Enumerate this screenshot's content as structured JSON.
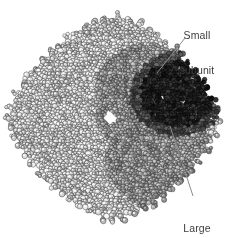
{
  "figure": {
    "kind": "space-filling-molecular-model",
    "background_color": "#ffffff",
    "width": 233,
    "height": 238
  },
  "annotations": {
    "small_subunit": {
      "line1": "Small",
      "line2": "subunit",
      "text_color": "#3d3d3d",
      "leader": {
        "x1": 185,
        "y1": 38,
        "x2": 157,
        "y2": 73,
        "color": "#8c8c8c"
      }
    },
    "large_subunit": {
      "line1": "Large",
      "line2": "subunit",
      "text_color": "#3d3d3d",
      "leader": {
        "x1": 193,
        "y1": 196,
        "x2": 170,
        "y2": 126,
        "color": "#8c8c8c"
      }
    }
  },
  "molecule": {
    "silhouette_note": "rounded diamond / octagonal outline of packed spheres",
    "bounds": {
      "left": 10,
      "top": 18,
      "right": 218,
      "bottom": 218
    },
    "center_pore": {
      "x": 110,
      "y": 118,
      "w": 13,
      "h": 13,
      "color": "#ffffff"
    },
    "palette": {
      "light_lobe": "#d8d8d8",
      "mid_gray": "#9a9a9a",
      "dark_gray": "#555555",
      "small_subunit_dark": "#1d1d1d",
      "outline": "#2b2b2b"
    },
    "lobes": [
      {
        "name": "upper-left-light",
        "cx": 78,
        "cy": 80,
        "rx": 58,
        "ry": 52,
        "tone": "light"
      },
      {
        "name": "lower-left-light",
        "cx": 72,
        "cy": 152,
        "rx": 58,
        "ry": 52,
        "tone": "light"
      },
      {
        "name": "upper-right-dark",
        "cx": 168,
        "cy": 92,
        "rx": 50,
        "ry": 44,
        "tone": "dark"
      },
      {
        "name": "lower-right-mid",
        "cx": 160,
        "cy": 158,
        "rx": 52,
        "ry": 48,
        "tone": "mid"
      }
    ]
  }
}
